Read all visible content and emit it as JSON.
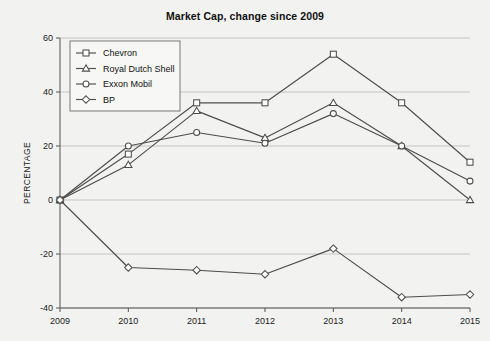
{
  "chart_data": {
    "type": "line",
    "title": "Market Cap, change since 2009",
    "xlabel": "",
    "ylabel": "PERCENTAGE",
    "x": [
      2009,
      2010,
      2011,
      2012,
      2013,
      2014,
      2015
    ],
    "xticklabels": [
      "2009",
      "2010",
      "2011",
      "2012",
      "2013",
      "2014",
      "2015"
    ],
    "yticks": [
      -40,
      -20,
      0,
      20,
      40,
      60
    ],
    "yticklabels": [
      "-40",
      "-20",
      "0",
      "20",
      "40",
      "60"
    ],
    "ylim": [
      -40,
      60
    ],
    "xlim": [
      2009,
      2015
    ],
    "grid": true,
    "legend_position": "upper left",
    "series": [
      {
        "name": "Chevron",
        "marker": "square",
        "color": "#4d4d4d",
        "values": [
          0,
          17,
          36,
          36,
          54,
          36,
          14
        ]
      },
      {
        "name": "Royal Dutch Shell",
        "marker": "triangle",
        "color": "#4d4d4d",
        "values": [
          0,
          13,
          33,
          23,
          36,
          20,
          0
        ]
      },
      {
        "name": "Exxon Mobil",
        "marker": "circle",
        "color": "#4d4d4d",
        "values": [
          0,
          20,
          25,
          21,
          32,
          20,
          7
        ]
      },
      {
        "name": "BP",
        "marker": "diamond",
        "color": "#4d4d4d",
        "values": [
          0,
          -25,
          -26,
          -27.5,
          -18,
          -36,
          -35
        ]
      }
    ]
  },
  "legend": {
    "items": [
      {
        "label": "Chevron"
      },
      {
        "label": "Royal Dutch Shell"
      },
      {
        "label": "Exxon Mobil"
      },
      {
        "label": "BP"
      }
    ]
  },
  "colors": {
    "background": "#f2f2f0",
    "grid": "#b9b9bb",
    "axis": "#555555",
    "line": "#4d4d4d",
    "marker_fill": "#ffffff",
    "text": "#111111"
  }
}
